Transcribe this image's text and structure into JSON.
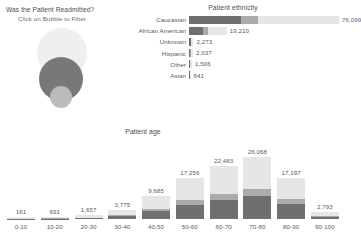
{
  "bubble_panel": {
    "title": "Was the Patient Readmitted?",
    "subtitle": "Click on Bubble to Filter",
    "bubbles": [
      {
        "name": "no-readmission-bubble",
        "color": "#efefef"
      },
      {
        "name": "readmitted-over-30-bubble",
        "color": "#77787a"
      },
      {
        "name": "readmitted-under-30-bubble",
        "color": "#b9bbbd"
      }
    ]
  },
  "ethnicity": {
    "title": "Patient ethnicity",
    "chart_data": {
      "type": "bar",
      "orientation": "horizontal",
      "title": "Patient ethnicity",
      "xlabel": "",
      "ylabel": "",
      "categories": [
        "Caucasian",
        "African American",
        "Unknown",
        "Hispanic",
        "Other",
        "Asian"
      ],
      "values": [
        76099,
        19210,
        2273,
        2037,
        1506,
        641
      ],
      "value_labels": [
        "76,099",
        "19,210",
        "2,273",
        "2,037",
        "1,506",
        "641"
      ],
      "xlim": [
        0,
        76099
      ],
      "grid": false,
      "stacked": true,
      "series": [
        {
          "name": "Readmitted >30",
          "color": "#6e6f71",
          "values": [
            26500,
            7000,
            820,
            700,
            520,
            230
          ]
        },
        {
          "name": "Readmitted <30",
          "color": "#a9abad",
          "values": [
            8300,
            2400,
            260,
            230,
            170,
            70
          ]
        },
        {
          "name": "Not readmitted",
          "color": "#e6e6e6",
          "values": [
            41299,
            9810,
            1193,
            1107,
            816,
            341
          ]
        }
      ]
    }
  },
  "age": {
    "title": "Patient age",
    "chart_data": {
      "type": "bar",
      "orientation": "vertical",
      "title": "Patient age",
      "xlabel": "",
      "ylabel": "",
      "categories": [
        "0-10",
        "10-20",
        "20-30",
        "30-40",
        "40-50",
        "50-60",
        "60-70",
        "70-80",
        "80-90",
        "90-100"
      ],
      "values": [
        161,
        691,
        1657,
        3775,
        9685,
        17256,
        22483,
        26068,
        17197,
        2793
      ],
      "value_labels": [
        "161",
        "691",
        "1,657",
        "3,775",
        "9,685",
        "17,256",
        "22,483",
        "26,068",
        "17,197",
        "2,793"
      ],
      "ylim": [
        0,
        26068
      ],
      "grid": false,
      "stacked": true,
      "series": [
        {
          "name": "Readmitted >30",
          "color": "#6e6f71",
          "values": [
            40,
            180,
            470,
            1150,
            3300,
            6100,
            8100,
            9600,
            6300,
            1000
          ]
        },
        {
          "name": "Readmitted <30",
          "color": "#a9abad",
          "values": [
            12,
            60,
            150,
            380,
            1000,
            1750,
            2500,
            3000,
            1950,
            300
          ]
        },
        {
          "name": "Not readmitted",
          "color": "#e6e6e6",
          "values": [
            109,
            451,
            1037,
            2245,
            5385,
            9406,
            11883,
            13468,
            8947,
            1493
          ]
        }
      ]
    }
  },
  "colors": {
    "dark_gray": "#6e6f71",
    "mid_gray": "#a9abad",
    "light_gray": "#e6e6e6",
    "bubble_light": "#efefef",
    "bubble_dark": "#77787a",
    "bubble_small": "#b9bbbd",
    "text": "#5a5a5a",
    "background": "#ffffff"
  }
}
